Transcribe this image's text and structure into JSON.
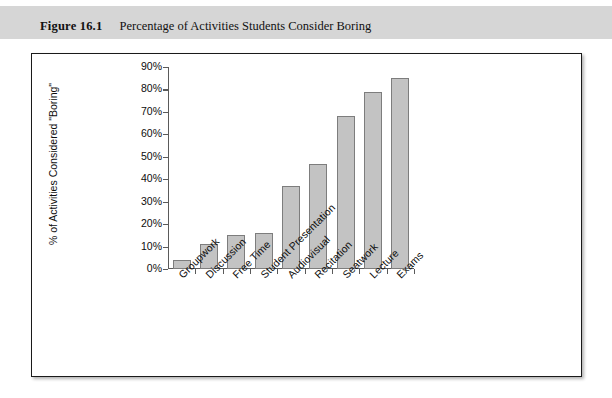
{
  "caption": {
    "figure_number": "Figure 16.1",
    "title": "Percentage of Activities Students Consider Boring"
  },
  "colors": {
    "caption_band": "#d6d6d6",
    "bar_fill": "#c3c3c3",
    "bar_border": "#7d7d7d",
    "axis": "#5a5a5a",
    "panel_border": "#1a1a1a",
    "text": "#0d0d0d"
  },
  "chart_data": {
    "type": "bar",
    "title": "Percentage of Activities Students Consider Boring",
    "xlabel": "",
    "ylabel": "% of Activities Considered \"Boring\"",
    "categories": [
      "Groupwork",
      "Discussion",
      "Free Time",
      "Student Presentation",
      "Audiovisual",
      "Recitation",
      "Seatwork",
      "Lecture",
      "Exams"
    ],
    "values": [
      4,
      11,
      15,
      16,
      37,
      47,
      68,
      79,
      85
    ],
    "ylim": [
      0,
      90
    ],
    "ytick_step": 10,
    "ytick_labels": [
      "0%",
      "10%",
      "20%",
      "30%",
      "40%",
      "50%",
      "60%",
      "70%",
      "80%",
      "90%"
    ],
    "grid": false,
    "legend": null
  }
}
